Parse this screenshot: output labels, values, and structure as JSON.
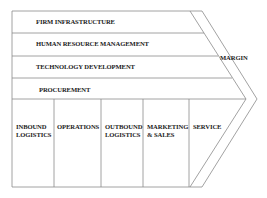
{
  "diagram": {
    "support_activities": [
      {
        "label": "FIRM INFRASTRUCTURE"
      },
      {
        "label": "HUMAN RESOURCE MANAGEMENT"
      },
      {
        "label": "TECHNOLOGY DEVELOPMENT"
      },
      {
        "label": "PROCUREMENT"
      }
    ],
    "primary_activities": [
      {
        "line1": "INBOUND",
        "line2": "LOGISTICS"
      },
      {
        "line1": "OPERATIONS",
        "line2": ""
      },
      {
        "line1": "OUTBOUND",
        "line2": "LOGISTICS"
      },
      {
        "line1": "MARKETING",
        "line2": "& SALES"
      },
      {
        "line1": "SERVICE",
        "line2": ""
      }
    ],
    "margin_label": "MARGIN",
    "colors": {
      "line": "#8a8a8a",
      "text": "#222222"
    }
  }
}
